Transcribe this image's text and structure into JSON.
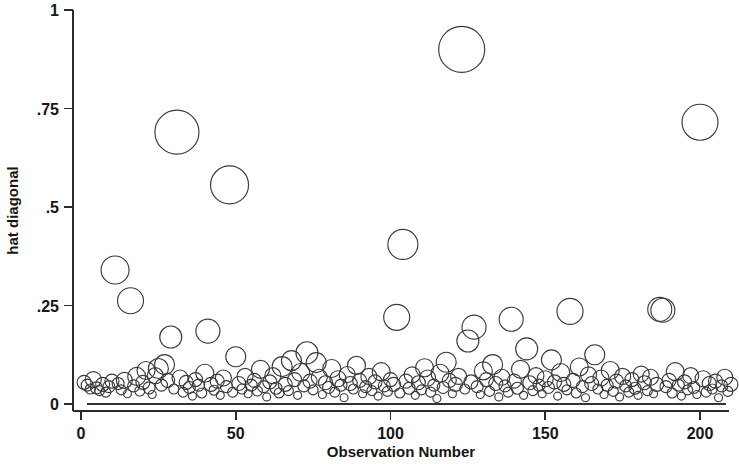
{
  "chart_data": {
    "type": "scatter",
    "title": "",
    "subtitle": "",
    "xlabel": "Observation Number",
    "ylabel": "hat diagonal",
    "xlim": [
      -4,
      212
    ],
    "ylim": [
      0,
      1
    ],
    "grid": false,
    "legend": null,
    "xticks": [
      0,
      50,
      100,
      150,
      200
    ],
    "xticklabels": [
      "0",
      "50",
      "100",
      "150",
      "200"
    ],
    "yticks": [
      0,
      0.25,
      0.5,
      0.75,
      1
    ],
    "yticklabels": [
      "0",
      ".25",
      ".5",
      ".75",
      "1"
    ],
    "marker": "open-circle",
    "marker_color": "#3a3a3a",
    "size_encoding": "Cook's D (bubble area)",
    "reference_line_y": 0,
    "note": "Stata lvr2plot style leverage-versus-observation bubble plot; bubble radius encodes Cook's distance.",
    "series": [
      {
        "name": "hat diagonal",
        "points": [
          {
            "x": 1,
            "y": 0.055,
            "r": 7
          },
          {
            "x": 2,
            "y": 0.048,
            "r": 6
          },
          {
            "x": 3,
            "y": 0.038,
            "r": 5
          },
          {
            "x": 4,
            "y": 0.062,
            "r": 8
          },
          {
            "x": 5,
            "y": 0.041,
            "r": 6
          },
          {
            "x": 6,
            "y": 0.034,
            "r": 5
          },
          {
            "x": 7,
            "y": 0.05,
            "r": 7
          },
          {
            "x": 8,
            "y": 0.03,
            "r": 5
          },
          {
            "x": 9,
            "y": 0.044,
            "r": 6
          },
          {
            "x": 10,
            "y": 0.058,
            "r": 7
          },
          {
            "x": 11,
            "y": 0.34,
            "r": 14
          },
          {
            "x": 12,
            "y": 0.052,
            "r": 6
          },
          {
            "x": 13,
            "y": 0.036,
            "r": 5
          },
          {
            "x": 14,
            "y": 0.06,
            "r": 8
          },
          {
            "x": 15,
            "y": 0.026,
            "r": 4
          },
          {
            "x": 16,
            "y": 0.262,
            "r": 13
          },
          {
            "x": 17,
            "y": 0.046,
            "r": 6
          },
          {
            "x": 18,
            "y": 0.07,
            "r": 9
          },
          {
            "x": 19,
            "y": 0.033,
            "r": 5
          },
          {
            "x": 20,
            "y": 0.055,
            "r": 7
          },
          {
            "x": 21,
            "y": 0.085,
            "r": 9
          },
          {
            "x": 22,
            "y": 0.041,
            "r": 6
          },
          {
            "x": 23,
            "y": 0.024,
            "r": 4
          },
          {
            "x": 24,
            "y": 0.072,
            "r": 8
          },
          {
            "x": 25,
            "y": 0.09,
            "r": 10
          },
          {
            "x": 26,
            "y": 0.048,
            "r": 6
          },
          {
            "x": 27,
            "y": 0.1,
            "r": 10
          },
          {
            "x": 28,
            "y": 0.06,
            "r": 7
          },
          {
            "x": 29,
            "y": 0.17,
            "r": 11
          },
          {
            "x": 30,
            "y": 0.038,
            "r": 5
          },
          {
            "x": 31,
            "y": 0.69,
            "r": 22
          },
          {
            "x": 32,
            "y": 0.066,
            "r": 8
          },
          {
            "x": 33,
            "y": 0.03,
            "r": 5
          },
          {
            "x": 34,
            "y": 0.055,
            "r": 7
          },
          {
            "x": 35,
            "y": 0.042,
            "r": 6
          },
          {
            "x": 36,
            "y": 0.02,
            "r": 4
          },
          {
            "x": 37,
            "y": 0.062,
            "r": 7
          },
          {
            "x": 38,
            "y": 0.048,
            "r": 6
          },
          {
            "x": 39,
            "y": 0.028,
            "r": 5
          },
          {
            "x": 40,
            "y": 0.078,
            "r": 9
          },
          {
            "x": 41,
            "y": 0.185,
            "r": 12
          },
          {
            "x": 42,
            "y": 0.05,
            "r": 7
          },
          {
            "x": 43,
            "y": 0.035,
            "r": 5
          },
          {
            "x": 44,
            "y": 0.058,
            "r": 7
          },
          {
            "x": 45,
            "y": 0.022,
            "r": 4
          },
          {
            "x": 46,
            "y": 0.066,
            "r": 8
          },
          {
            "x": 47,
            "y": 0.044,
            "r": 6
          },
          {
            "x": 48,
            "y": 0.556,
            "r": 19
          },
          {
            "x": 49,
            "y": 0.03,
            "r": 5
          },
          {
            "x": 50,
            "y": 0.12,
            "r": 10
          },
          {
            "x": 51,
            "y": 0.052,
            "r": 7
          },
          {
            "x": 52,
            "y": 0.038,
            "r": 5
          },
          {
            "x": 53,
            "y": 0.07,
            "r": 8
          },
          {
            "x": 54,
            "y": 0.026,
            "r": 4
          },
          {
            "x": 55,
            "y": 0.048,
            "r": 6
          },
          {
            "x": 56,
            "y": 0.06,
            "r": 7
          },
          {
            "x": 57,
            "y": 0.033,
            "r": 5
          },
          {
            "x": 58,
            "y": 0.088,
            "r": 9
          },
          {
            "x": 59,
            "y": 0.044,
            "r": 6
          },
          {
            "x": 60,
            "y": 0.018,
            "r": 4
          },
          {
            "x": 61,
            "y": 0.056,
            "r": 7
          },
          {
            "x": 62,
            "y": 0.072,
            "r": 8
          },
          {
            "x": 63,
            "y": 0.04,
            "r": 6
          },
          {
            "x": 64,
            "y": 0.028,
            "r": 5
          },
          {
            "x": 65,
            "y": 0.095,
            "r": 10
          },
          {
            "x": 66,
            "y": 0.05,
            "r": 7
          },
          {
            "x": 67,
            "y": 0.034,
            "r": 5
          },
          {
            "x": 68,
            "y": 0.11,
            "r": 10
          },
          {
            "x": 69,
            "y": 0.062,
            "r": 7
          },
          {
            "x": 70,
            "y": 0.022,
            "r": 4
          },
          {
            "x": 71,
            "y": 0.08,
            "r": 9
          },
          {
            "x": 72,
            "y": 0.046,
            "r": 6
          },
          {
            "x": 73,
            "y": 0.13,
            "r": 11
          },
          {
            "x": 74,
            "y": 0.058,
            "r": 7
          },
          {
            "x": 75,
            "y": 0.036,
            "r": 5
          },
          {
            "x": 76,
            "y": 0.105,
            "r": 10
          },
          {
            "x": 77,
            "y": 0.068,
            "r": 8
          },
          {
            "x": 78,
            "y": 0.024,
            "r": 4
          },
          {
            "x": 79,
            "y": 0.054,
            "r": 7
          },
          {
            "x": 80,
            "y": 0.042,
            "r": 6
          },
          {
            "x": 81,
            "y": 0.09,
            "r": 9
          },
          {
            "x": 82,
            "y": 0.03,
            "r": 5
          },
          {
            "x": 83,
            "y": 0.064,
            "r": 8
          },
          {
            "x": 84,
            "y": 0.048,
            "r": 6
          },
          {
            "x": 85,
            "y": 0.016,
            "r": 4
          },
          {
            "x": 86,
            "y": 0.075,
            "r": 8
          },
          {
            "x": 87,
            "y": 0.052,
            "r": 7
          },
          {
            "x": 88,
            "y": 0.038,
            "r": 5
          },
          {
            "x": 89,
            "y": 0.098,
            "r": 9
          },
          {
            "x": 90,
            "y": 0.06,
            "r": 7
          },
          {
            "x": 91,
            "y": 0.026,
            "r": 4
          },
          {
            "x": 92,
            "y": 0.044,
            "r": 6
          },
          {
            "x": 93,
            "y": 0.07,
            "r": 8
          },
          {
            "x": 94,
            "y": 0.034,
            "r": 5
          },
          {
            "x": 95,
            "y": 0.056,
            "r": 7
          },
          {
            "x": 96,
            "y": 0.02,
            "r": 4
          },
          {
            "x": 97,
            "y": 0.082,
            "r": 9
          },
          {
            "x": 98,
            "y": 0.046,
            "r": 6
          },
          {
            "x": 99,
            "y": 0.032,
            "r": 5
          },
          {
            "x": 100,
            "y": 0.062,
            "r": 7
          },
          {
            "x": 101,
            "y": 0.05,
            "r": 7
          },
          {
            "x": 102,
            "y": 0.22,
            "r": 13
          },
          {
            "x": 103,
            "y": 0.028,
            "r": 5
          },
          {
            "x": 104,
            "y": 0.405,
            "r": 15
          },
          {
            "x": 105,
            "y": 0.058,
            "r": 7
          },
          {
            "x": 106,
            "y": 0.04,
            "r": 6
          },
          {
            "x": 107,
            "y": 0.074,
            "r": 8
          },
          {
            "x": 108,
            "y": 0.022,
            "r": 4
          },
          {
            "x": 109,
            "y": 0.054,
            "r": 7
          },
          {
            "x": 110,
            "y": 0.036,
            "r": 5
          },
          {
            "x": 111,
            "y": 0.092,
            "r": 9
          },
          {
            "x": 112,
            "y": 0.066,
            "r": 8
          },
          {
            "x": 113,
            "y": 0.03,
            "r": 5
          },
          {
            "x": 114,
            "y": 0.048,
            "r": 6
          },
          {
            "x": 115,
            "y": 0.014,
            "r": 4
          },
          {
            "x": 116,
            "y": 0.078,
            "r": 9
          },
          {
            "x": 117,
            "y": 0.042,
            "r": 6
          },
          {
            "x": 118,
            "y": 0.106,
            "r": 10
          },
          {
            "x": 119,
            "y": 0.06,
            "r": 7
          },
          {
            "x": 120,
            "y": 0.026,
            "r": 4
          },
          {
            "x": 121,
            "y": 0.05,
            "r": 7
          },
          {
            "x": 122,
            "y": 0.07,
            "r": 8
          },
          {
            "x": 123,
            "y": 0.9,
            "r": 23
          },
          {
            "x": 124,
            "y": 0.038,
            "r": 5
          },
          {
            "x": 125,
            "y": 0.16,
            "r": 11
          },
          {
            "x": 126,
            "y": 0.056,
            "r": 7
          },
          {
            "x": 127,
            "y": 0.195,
            "r": 12
          },
          {
            "x": 128,
            "y": 0.044,
            "r": 6
          },
          {
            "x": 129,
            "y": 0.024,
            "r": 4
          },
          {
            "x": 130,
            "y": 0.084,
            "r": 9
          },
          {
            "x": 131,
            "y": 0.062,
            "r": 7
          },
          {
            "x": 132,
            "y": 0.032,
            "r": 5
          },
          {
            "x": 133,
            "y": 0.1,
            "r": 10
          },
          {
            "x": 134,
            "y": 0.052,
            "r": 7
          },
          {
            "x": 135,
            "y": 0.018,
            "r": 4
          },
          {
            "x": 136,
            "y": 0.068,
            "r": 8
          },
          {
            "x": 137,
            "y": 0.046,
            "r": 6
          },
          {
            "x": 138,
            "y": 0.03,
            "r": 5
          },
          {
            "x": 139,
            "y": 0.215,
            "r": 12
          },
          {
            "x": 140,
            "y": 0.058,
            "r": 7
          },
          {
            "x": 141,
            "y": 0.04,
            "r": 6
          },
          {
            "x": 142,
            "y": 0.088,
            "r": 9
          },
          {
            "x": 143,
            "y": 0.022,
            "r": 4
          },
          {
            "x": 144,
            "y": 0.14,
            "r": 11
          },
          {
            "x": 145,
            "y": 0.054,
            "r": 7
          },
          {
            "x": 146,
            "y": 0.034,
            "r": 5
          },
          {
            "x": 147,
            "y": 0.072,
            "r": 8
          },
          {
            "x": 148,
            "y": 0.048,
            "r": 6
          },
          {
            "x": 149,
            "y": 0.026,
            "r": 4
          },
          {
            "x": 150,
            "y": 0.064,
            "r": 8
          },
          {
            "x": 151,
            "y": 0.042,
            "r": 6
          },
          {
            "x": 152,
            "y": 0.112,
            "r": 10
          },
          {
            "x": 153,
            "y": 0.056,
            "r": 7
          },
          {
            "x": 154,
            "y": 0.02,
            "r": 4
          },
          {
            "x": 155,
            "y": 0.08,
            "r": 9
          },
          {
            "x": 156,
            "y": 0.05,
            "r": 7
          },
          {
            "x": 157,
            "y": 0.036,
            "r": 5
          },
          {
            "x": 158,
            "y": 0.235,
            "r": 13
          },
          {
            "x": 159,
            "y": 0.06,
            "r": 7
          },
          {
            "x": 160,
            "y": 0.028,
            "r": 5
          },
          {
            "x": 161,
            "y": 0.094,
            "r": 9
          },
          {
            "x": 162,
            "y": 0.044,
            "r": 6
          },
          {
            "x": 163,
            "y": 0.016,
            "r": 4
          },
          {
            "x": 164,
            "y": 0.074,
            "r": 8
          },
          {
            "x": 165,
            "y": 0.052,
            "r": 7
          },
          {
            "x": 166,
            "y": 0.125,
            "r": 10
          },
          {
            "x": 167,
            "y": 0.038,
            "r": 5
          },
          {
            "x": 168,
            "y": 0.066,
            "r": 8
          },
          {
            "x": 169,
            "y": 0.024,
            "r": 4
          },
          {
            "x": 170,
            "y": 0.048,
            "r": 6
          },
          {
            "x": 171,
            "y": 0.085,
            "r": 9
          },
          {
            "x": 172,
            "y": 0.032,
            "r": 5
          },
          {
            "x": 173,
            "y": 0.058,
            "r": 7
          },
          {
            "x": 174,
            "y": 0.018,
            "r": 4
          },
          {
            "x": 175,
            "y": 0.07,
            "r": 8
          },
          {
            "x": 176,
            "y": 0.046,
            "r": 6
          },
          {
            "x": 177,
            "y": 0.03,
            "r": 5
          },
          {
            "x": 178,
            "y": 0.062,
            "r": 7
          },
          {
            "x": 179,
            "y": 0.04,
            "r": 6
          },
          {
            "x": 180,
            "y": 0.022,
            "r": 4
          },
          {
            "x": 181,
            "y": 0.076,
            "r": 8
          },
          {
            "x": 182,
            "y": 0.054,
            "r": 7
          },
          {
            "x": 183,
            "y": 0.034,
            "r": 5
          },
          {
            "x": 184,
            "y": 0.068,
            "r": 8
          },
          {
            "x": 185,
            "y": 0.026,
            "r": 4
          },
          {
            "x": 186,
            "y": 0.05,
            "r": 7
          },
          {
            "x": 187,
            "y": 0.24,
            "r": 12
          },
          {
            "x": 188,
            "y": 0.238,
            "r": 12
          },
          {
            "x": 189,
            "y": 0.044,
            "r": 6
          },
          {
            "x": 190,
            "y": 0.06,
            "r": 7
          },
          {
            "x": 191,
            "y": 0.028,
            "r": 5
          },
          {
            "x": 192,
            "y": 0.082,
            "r": 9
          },
          {
            "x": 193,
            "y": 0.048,
            "r": 6
          },
          {
            "x": 194,
            "y": 0.02,
            "r": 4
          },
          {
            "x": 195,
            "y": 0.056,
            "r": 7
          },
          {
            "x": 196,
            "y": 0.036,
            "r": 5
          },
          {
            "x": 197,
            "y": 0.072,
            "r": 8
          },
          {
            "x": 198,
            "y": 0.042,
            "r": 6
          },
          {
            "x": 199,
            "y": 0.024,
            "r": 4
          },
          {
            "x": 200,
            "y": 0.715,
            "r": 18
          },
          {
            "x": 201,
            "y": 0.064,
            "r": 8
          },
          {
            "x": 202,
            "y": 0.03,
            "r": 5
          },
          {
            "x": 203,
            "y": 0.052,
            "r": 7
          },
          {
            "x": 204,
            "y": 0.038,
            "r": 5
          },
          {
            "x": 205,
            "y": 0.058,
            "r": 7
          },
          {
            "x": 206,
            "y": 0.016,
            "r": 4
          },
          {
            "x": 207,
            "y": 0.046,
            "r": 6
          },
          {
            "x": 208,
            "y": 0.068,
            "r": 8
          },
          {
            "x": 209,
            "y": 0.032,
            "r": 5
          },
          {
            "x": 210,
            "y": 0.05,
            "r": 7
          }
        ]
      }
    ]
  }
}
